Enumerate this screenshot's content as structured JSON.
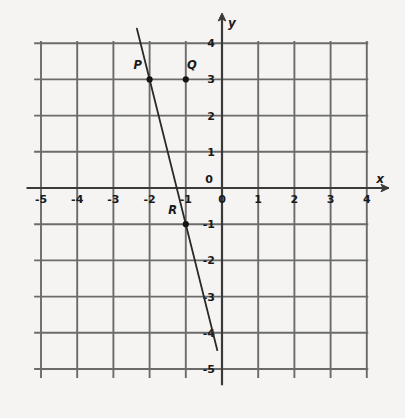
{
  "chart_data": {
    "type": "line",
    "title": "",
    "xlabel": "x",
    "ylabel": "y",
    "xlim": [
      -5.2,
      4.3
    ],
    "ylim": [
      -5.6,
      4.4
    ],
    "grid": true,
    "grid_step": 1,
    "legend": "none",
    "x_tick_labels": [
      "-5",
      "-4",
      "-3",
      "-2",
      "-1",
      "0",
      "1",
      "2",
      "3",
      "4"
    ],
    "x_tick_values": [
      -5,
      -4,
      -3,
      -2,
      -1,
      0,
      1,
      2,
      3,
      4
    ],
    "y_tick_labels": [
      "4",
      "3",
      "2",
      "1",
      "0",
      "-1",
      "-2",
      "-3",
      "-4",
      "-5"
    ],
    "y_tick_values": [
      4,
      3,
      2,
      1,
      0,
      -1,
      -2,
      -3,
      -4,
      -5
    ],
    "series": [
      {
        "name": "line",
        "equation": "y = -4x - 5",
        "slope": -4,
        "intercept": -5,
        "x": [
          -2.35,
          -0.13
        ],
        "values": [
          4.4,
          -4.5
        ]
      }
    ],
    "points": [
      {
        "label": "P",
        "x": -2,
        "y": 3,
        "label_dx": -12,
        "label_dy": -10
      },
      {
        "label": "Q",
        "x": -1,
        "y": 3,
        "label_dx": 6,
        "label_dy": -10
      },
      {
        "label": "R",
        "x": -1,
        "y": -1,
        "label_dx": -13,
        "label_dy": -10
      }
    ],
    "colors": {
      "background": "#f5f4f2",
      "grid": "#6b6b6b",
      "axis": "#3a3a3a",
      "line": "#2a2a2a",
      "point": "#151515",
      "text": "#1a1a1a"
    }
  },
  "axes": {
    "x_axis_label": "x",
    "y_axis_label": "y",
    "origin_label_x": "0",
    "origin_label_y": "0"
  }
}
